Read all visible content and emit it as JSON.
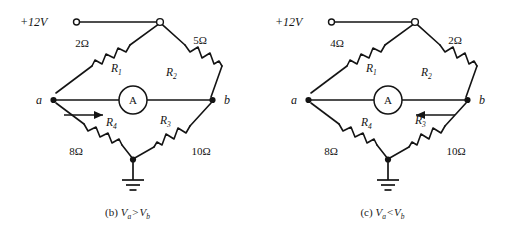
{
  "figures": [
    {
      "id": "figure-b",
      "caption": {
        "label": "(b)",
        "left_symbol": "V",
        "left_sub": "a",
        "relation": ">",
        "right_symbol": "V",
        "right_sub": "b"
      },
      "supply": {
        "label": "+12V",
        "terminal": "open-circle-terminal"
      },
      "nodes": {
        "left": "a",
        "right": "b"
      },
      "meter": {
        "label": "A",
        "name": "ammeter"
      },
      "current_arrow": {
        "direction": "right",
        "description": "current flows from a toward b"
      },
      "resistors": [
        {
          "name": "R1",
          "label": "R",
          "sub": "1",
          "value": "2Ω",
          "position": "top-left"
        },
        {
          "name": "R2",
          "label": "R",
          "sub": "2",
          "value": "5Ω",
          "position": "top-right"
        },
        {
          "name": "R3",
          "label": "R",
          "sub": "3",
          "value": "10Ω",
          "position": "bottom-right"
        },
        {
          "name": "R4",
          "label": "R",
          "sub": "4",
          "value": "8Ω",
          "position": "bottom-left"
        }
      ],
      "ground": "earth-ground"
    },
    {
      "id": "figure-c",
      "caption": {
        "label": "(c)",
        "left_symbol": "V",
        "left_sub": "a",
        "relation": "<",
        "right_symbol": "V",
        "right_sub": "b"
      },
      "supply": {
        "label": "+12V",
        "terminal": "open-circle-terminal"
      },
      "nodes": {
        "left": "a",
        "right": "b"
      },
      "meter": {
        "label": "A",
        "name": "ammeter"
      },
      "current_arrow": {
        "direction": "left",
        "description": "current flows from b toward a"
      },
      "resistors": [
        {
          "name": "R1",
          "label": "R",
          "sub": "1",
          "value": "4Ω",
          "position": "top-left"
        },
        {
          "name": "R2",
          "label": "R",
          "sub": "2",
          "value": "2Ω",
          "position": "top-right"
        },
        {
          "name": "R3",
          "label": "R",
          "sub": "3",
          "value": "10Ω",
          "position": "bottom-right"
        },
        {
          "name": "R4",
          "label": "R",
          "sub": "4",
          "value": "8Ω",
          "position": "bottom-left"
        }
      ],
      "ground": "earth-ground"
    }
  ],
  "colors": {
    "ink": "#141414",
    "background": "#ffffff"
  }
}
